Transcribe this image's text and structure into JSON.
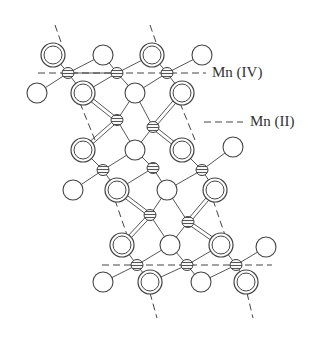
{
  "diagram": {
    "type": "crystal-structure",
    "colors": {
      "stroke": "#444444",
      "background": "#ffffff",
      "hatch": "#555555"
    },
    "labels": [
      {
        "id": "mn-iv",
        "text": "Mn (IV)",
        "x": 212,
        "y": 64,
        "legend_dash": false
      },
      {
        "id": "mn-ii",
        "text": "Mn (II)",
        "x": 250,
        "y": 113,
        "legend_dash": true,
        "dash_x1": 204,
        "dash_x2": 243,
        "dash_y": 122
      }
    ],
    "mn_iv_planes": [
      {
        "x1": 38,
        "y1": 73,
        "x2": 206,
        "y2": 73
      },
      {
        "x1": 102,
        "y1": 265,
        "x2": 272,
        "y2": 265
      }
    ],
    "diagonal_dashes": [
      {
        "x1": 55,
        "y1": 25,
        "x2": 62,
        "y2": 45
      },
      {
        "x1": 150,
        "y1": 25,
        "x2": 157,
        "y2": 45
      },
      {
        "x1": 80,
        "y1": 103,
        "x2": 95,
        "y2": 140
      },
      {
        "x1": 180,
        "y1": 103,
        "x2": 195,
        "y2": 140
      },
      {
        "x1": 115,
        "y1": 200,
        "x2": 127,
        "y2": 235
      },
      {
        "x1": 213,
        "y1": 200,
        "x2": 225,
        "y2": 235
      },
      {
        "x1": 150,
        "y1": 293,
        "x2": 157,
        "y2": 318
      },
      {
        "x1": 247,
        "y1": 293,
        "x2": 253,
        "y2": 318
      }
    ],
    "large_double": [
      [
        53,
        55
      ],
      [
        152,
        55
      ],
      [
        83,
        93
      ],
      [
        182,
        93
      ],
      [
        83,
        150
      ],
      [
        182,
        150
      ],
      [
        117,
        190
      ],
      [
        215,
        190
      ],
      [
        122,
        245
      ],
      [
        221,
        245
      ],
      [
        150,
        282
      ],
      [
        246,
        282
      ]
    ],
    "open_atoms": [
      [
        103,
        55
      ],
      [
        202,
        55
      ],
      [
        37,
        93
      ],
      [
        135,
        93
      ],
      [
        135,
        150
      ],
      [
        233,
        147
      ],
      [
        73,
        190
      ],
      [
        167,
        190
      ],
      [
        170,
        245
      ],
      [
        266,
        247
      ],
      [
        103,
        282
      ],
      [
        201,
        282
      ]
    ],
    "mn_iv_atoms": [
      [
        68,
        73
      ],
      [
        117,
        73
      ],
      [
        167,
        73
      ],
      [
        103,
        170
      ],
      [
        153,
        168
      ],
      [
        202,
        170
      ],
      [
        137,
        265
      ],
      [
        187,
        265
      ],
      [
        236,
        265
      ]
    ],
    "mn_ii_atoms": [
      [
        117,
        120
      ],
      [
        153,
        127
      ],
      [
        150,
        215
      ],
      [
        188,
        222
      ]
    ],
    "bonds_single": [
      [
        [
          53,
          55
        ],
        [
          68,
          73
        ]
      ],
      [
        [
          68,
          73
        ],
        [
          103,
          55
        ]
      ],
      [
        [
          68,
          73
        ],
        [
          37,
          93
        ]
      ],
      [
        [
          68,
          73
        ],
        [
          83,
          93
        ]
      ],
      [
        [
          68,
          73
        ],
        [
          117,
          73
        ]
      ],
      [
        [
          103,
          55
        ],
        [
          117,
          73
        ]
      ],
      [
        [
          117,
          73
        ],
        [
          152,
          55
        ]
      ],
      [
        [
          117,
          73
        ],
        [
          135,
          93
        ]
      ],
      [
        [
          117,
          73
        ],
        [
          83,
          93
        ]
      ],
      [
        [
          152,
          55
        ],
        [
          167,
          73
        ]
      ],
      [
        [
          167,
          73
        ],
        [
          202,
          55
        ]
      ],
      [
        [
          167,
          73
        ],
        [
          182,
          93
        ]
      ],
      [
        [
          167,
          73
        ],
        [
          135,
          93
        ]
      ],
      [
        [
          135,
          93
        ],
        [
          117,
          120
        ]
      ],
      [
        [
          135,
          93
        ],
        [
          153,
          127
        ]
      ],
      [
        [
          117,
          120
        ],
        [
          135,
          150
        ]
      ],
      [
        [
          153,
          127
        ],
        [
          135,
          150
        ]
      ],
      [
        [
          135,
          150
        ],
        [
          103,
          170
        ]
      ],
      [
        [
          135,
          150
        ],
        [
          153,
          168
        ]
      ],
      [
        [
          83,
          150
        ],
        [
          103,
          170
        ]
      ],
      [
        [
          103,
          170
        ],
        [
          73,
          190
        ]
      ],
      [
        [
          103,
          170
        ],
        [
          117,
          190
        ]
      ],
      [
        [
          153,
          168
        ],
        [
          117,
          190
        ]
      ],
      [
        [
          153,
          168
        ],
        [
          167,
          190
        ]
      ],
      [
        [
          182,
          150
        ],
        [
          202,
          170
        ]
      ],
      [
        [
          202,
          170
        ],
        [
          233,
          147
        ]
      ],
      [
        [
          202,
          170
        ],
        [
          215,
          190
        ]
      ],
      [
        [
          202,
          170
        ],
        [
          167,
          190
        ]
      ],
      [
        [
          167,
          190
        ],
        [
          150,
          215
        ]
      ],
      [
        [
          167,
          190
        ],
        [
          188,
          222
        ]
      ],
      [
        [
          150,
          215
        ],
        [
          170,
          245
        ]
      ],
      [
        [
          188,
          222
        ],
        [
          170,
          245
        ]
      ],
      [
        [
          122,
          245
        ],
        [
          137,
          265
        ]
      ],
      [
        [
          137,
          265
        ],
        [
          103,
          282
        ]
      ],
      [
        [
          137,
          265
        ],
        [
          150,
          282
        ]
      ],
      [
        [
          137,
          265
        ],
        [
          170,
          245
        ]
      ],
      [
        [
          170,
          245
        ],
        [
          187,
          265
        ]
      ],
      [
        [
          187,
          265
        ],
        [
          150,
          282
        ]
      ],
      [
        [
          187,
          265
        ],
        [
          201,
          282
        ]
      ],
      [
        [
          187,
          265
        ],
        [
          221,
          245
        ]
      ],
      [
        [
          221,
          245
        ],
        [
          236,
          265
        ]
      ],
      [
        [
          236,
          265
        ],
        [
          266,
          247
        ]
      ],
      [
        [
          236,
          265
        ],
        [
          246,
          282
        ]
      ],
      [
        [
          236,
          265
        ],
        [
          201,
          282
        ]
      ]
    ],
    "bonds_double": [
      [
        [
          83,
          93
        ],
        [
          117,
          120
        ]
      ],
      [
        [
          117,
          120
        ],
        [
          83,
          150
        ]
      ],
      [
        [
          182,
          93
        ],
        [
          153,
          127
        ]
      ],
      [
        [
          153,
          127
        ],
        [
          182,
          150
        ]
      ],
      [
        [
          117,
          190
        ],
        [
          150,
          215
        ]
      ],
      [
        [
          150,
          215
        ],
        [
          122,
          245
        ]
      ],
      [
        [
          215,
          190
        ],
        [
          188,
          222
        ]
      ],
      [
        [
          188,
          222
        ],
        [
          221,
          245
        ]
      ]
    ]
  }
}
